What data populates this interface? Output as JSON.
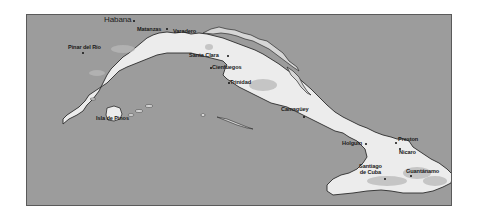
{
  "map": {
    "title": "Cuba",
    "colors": {
      "water": "#9c9c9c",
      "land": "#ececec",
      "coastline": "#2b2b2b",
      "highlands": "#b8b8b8",
      "frame_border": "#5a5a5a",
      "label": "#1a1a1a"
    },
    "capital": {
      "name": "Habana",
      "x": 103,
      "y": 14,
      "dot_x": 132,
      "dot_y": 20
    },
    "cities": [
      {
        "id": "pinar-del-rio",
        "name": "Pinar del Río",
        "label_x": 66,
        "label_y": 43,
        "dot_x": 81,
        "dot_y": 51
      },
      {
        "id": "matanzas",
        "name": "Matanzas",
        "label_x": 136,
        "label_y": 26,
        "dot_x": 166,
        "dot_y": 26
      },
      {
        "id": "varadero",
        "name": "Varadero",
        "label_x": 172,
        "label_y": 28,
        "dot_x": 172,
        "dot_y": 30
      },
      {
        "id": "santa-clara",
        "name": "Santa Clara",
        "label_x": 188,
        "label_y": 51,
        "dot_x": 227,
        "dot_y": 54
      },
      {
        "id": "cienfuegos",
        "name": "Cienfuegos",
        "label_x": 211,
        "label_y": 63,
        "dot_x": 209,
        "dot_y": 66
      },
      {
        "id": "trinidad",
        "name": "Trinidad",
        "label_x": 230,
        "label_y": 79,
        "dot_x": 228,
        "dot_y": 82
      },
      {
        "id": "camaguey",
        "name": "Camagüey",
        "label_x": 280,
        "label_y": 105,
        "dot_x": 302,
        "dot_y": 115
      },
      {
        "id": "holguin",
        "name": "Holguín",
        "label_x": 341,
        "label_y": 139,
        "dot_x": 365,
        "dot_y": 142
      },
      {
        "id": "preston",
        "name": "Preston",
        "label_x": 397,
        "label_y": 135,
        "dot_x": 394,
        "dot_y": 140
      },
      {
        "id": "nicaro",
        "name": "Nicaro",
        "label_x": 397,
        "label_y": 148,
        "dot_x": 397,
        "dot_y": 147
      },
      {
        "id": "santiago-de-cuba",
        "name": "Santiago\nde Cuba",
        "label_x": 358,
        "label_y": 162,
        "dot_x": 384,
        "dot_y": 177
      },
      {
        "id": "guantanamo",
        "name": "Guantánamo",
        "label_x": 405,
        "label_y": 167,
        "dot_x": 410,
        "dot_y": 174
      },
      {
        "id": "isla-de-pinos",
        "name": "Isla de Pinos",
        "label_x": 95,
        "label_y": 114,
        "dot_x": null,
        "dot_y": null
      }
    ]
  }
}
